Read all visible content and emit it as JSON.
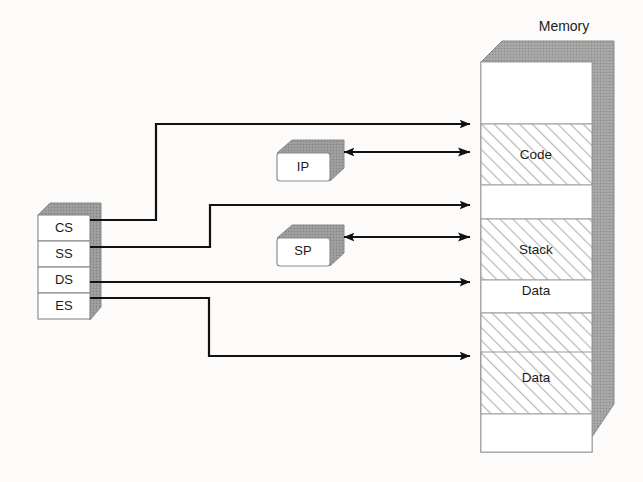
{
  "memory": {
    "label": "Memory",
    "bands": [
      {
        "name": "",
        "filled": false
      },
      {
        "name": "Code",
        "filled": true
      },
      {
        "name": "",
        "filled": false
      },
      {
        "name": "Stack",
        "filled": true
      },
      {
        "name": "",
        "filled": false
      },
      {
        "name": "Data",
        "filled": true
      },
      {
        "name": "",
        "filled": false
      },
      {
        "name": "Data",
        "filled": true
      },
      {
        "name": "",
        "filled": false
      }
    ]
  },
  "segment_registers": {
    "items": [
      {
        "label": "CS"
      },
      {
        "label": "SS"
      },
      {
        "label": "DS"
      },
      {
        "label": "ES"
      }
    ]
  },
  "pointer_registers": {
    "items": [
      {
        "label": "IP"
      },
      {
        "label": "SP"
      }
    ]
  },
  "colors": {
    "shadow": "#9c9c9c",
    "shadow_dark": "#8f8f8f",
    "hatch": "#b4b4b4",
    "line": "#111111",
    "text": "#1b1b1b",
    "box_fill": "#ffffff",
    "band_border": "#9a9a9a"
  },
  "connections": [
    {
      "from": "CS",
      "to": "Code",
      "note": "segment base to top of code block"
    },
    {
      "from": "CS",
      "to": "Code",
      "note": "code offset via IP"
    },
    {
      "from": "SS",
      "to": "Stack",
      "note": "segment base to top of stack block"
    },
    {
      "from": "SS",
      "to": "Stack",
      "note": "stack offset via SP"
    },
    {
      "from": "DS",
      "to": "Data",
      "note": "data segment base"
    },
    {
      "from": "ES",
      "to": "Data",
      "note": "extra segment base"
    },
    {
      "from": "Code",
      "to": "IP",
      "note": "instruction pointer offset"
    },
    {
      "from": "Stack",
      "to": "SP",
      "note": "stack pointer offset"
    }
  ]
}
